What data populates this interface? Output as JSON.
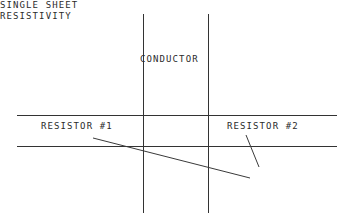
{
  "diagram": {
    "type": "line-drawing",
    "canvas": {
      "width": 350,
      "height": 223
    },
    "colors": {
      "background": "#ffffff",
      "line": "#333333",
      "leader": "#3a3a3a",
      "text": "#2b2b2b"
    },
    "labels": {
      "conductor": "CONDUCTOR",
      "resistor_1": "RESISTOR #1",
      "resistor_2": "RESISTOR #2",
      "single_sheet_line_1": "SINGLE SHEET",
      "single_sheet_line_2": "RESISTIVITY"
    },
    "geometry": {
      "vertical_lines": [
        {
          "name": "conductor-left-edge",
          "x": 143,
          "y1": 14,
          "y2": 213
        },
        {
          "name": "conductor-right-edge",
          "x": 208,
          "y1": 14,
          "y2": 213
        }
      ],
      "horizontal_lines": [
        {
          "name": "sheet-top-edge",
          "y": 115,
          "x1": 17,
          "x2": 337
        },
        {
          "name": "sheet-bottom-edge",
          "y": 146,
          "x1": 17,
          "x2": 337
        }
      ],
      "leaders": [
        {
          "name": "resistor-1-leader",
          "x1": 93,
          "y1": 138,
          "x2": 250,
          "y2": 178
        },
        {
          "name": "single-sheet-leader",
          "x1": 246,
          "y1": 135,
          "x2": 259,
          "y2": 167
        }
      ]
    }
  }
}
